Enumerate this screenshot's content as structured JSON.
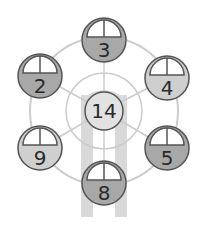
{
  "puzzle": {
    "hub": {
      "value": "14"
    },
    "cars": [
      {
        "id": "top",
        "value": "3",
        "shade": "dark",
        "cx": 104,
        "cy": 40
      },
      {
        "id": "upper-right",
        "value": "4",
        "shade": "light",
        "cx": 167,
        "cy": 78
      },
      {
        "id": "lower-right",
        "value": "5",
        "shade": "dark",
        "cx": 167,
        "cy": 148
      },
      {
        "id": "bottom",
        "value": "8",
        "shade": "dark",
        "cx": 104,
        "cy": 183
      },
      {
        "id": "lower-left",
        "value": "9",
        "shade": "light",
        "cx": 40,
        "cy": 148
      },
      {
        "id": "upper-left",
        "value": "2",
        "shade": "dark",
        "cx": 40,
        "cy": 76
      }
    ]
  },
  "colors": {
    "dark_car": "#a8a8a8",
    "light_car": "#cfcfcf",
    "window": "#ffffff",
    "outline": "#555555",
    "wheel_ring": "#cccccc",
    "legs": "#d9d9d9",
    "hub": "#e2e2e2"
  }
}
